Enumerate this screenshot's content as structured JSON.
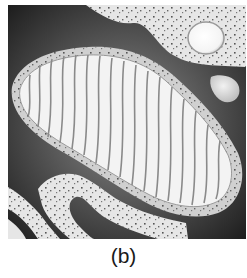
{
  "figure": {
    "panel_label": "(b)",
    "parts": [
      "outer-membrane",
      "inner-membrane",
      "cristae",
      "matrix",
      "cytoplasm-with-ribosomes",
      "vesicle",
      "lipid-droplet",
      "endoplasmic-reticulum"
    ]
  },
  "colors": {
    "background_dark": "#2a2a2a",
    "cytoplasm_light": "#e6e6e6",
    "membrane_band": "#cfcfcf",
    "matrix": "#f4f4f4",
    "cristae": "#8a8a8a",
    "dots": "#444444",
    "vesicle": "#fafafa"
  }
}
